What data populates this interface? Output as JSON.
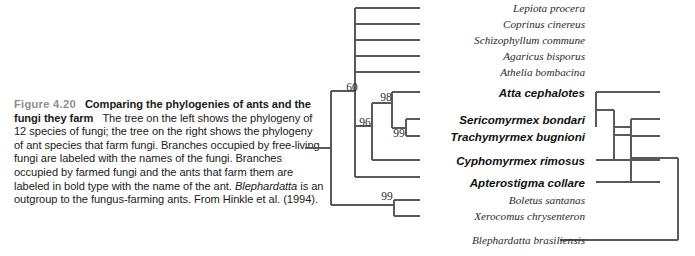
{
  "figure": {
    "number": "Figure 4.20",
    "lead": "Comparing the phylogenies of ants and the fungi they farm",
    "body_1": "The tree on the left shows the phylogeny of 12 species of fungi; the tree on the right shows the phylogeny of ant species that farm fungi. Branches occupied by free-living fungi are labeled with the names of the fungi. Branches occupied by farmed fungi and the ants that farm them are labeled in bold type with the name of the ant.",
    "italic_taxon": "Blephardatta",
    "body_2": "is an outgroup to the fungus-farming ants. From Hinkle et al. (1994)."
  },
  "taxa": [
    {
      "label": "Lepiota procera",
      "bold": false,
      "y": 8,
      "right": 585
    },
    {
      "label": "Coprinus cinereus",
      "bold": false,
      "y": 24,
      "right": 585
    },
    {
      "label": "Schizophyllum commune",
      "bold": false,
      "y": 40,
      "right": 585
    },
    {
      "label": "Agaricus bisporus",
      "bold": false,
      "y": 56,
      "right": 585
    },
    {
      "label": "Athelia bombacina",
      "bold": false,
      "y": 72,
      "right": 585
    },
    {
      "label": "Atta cephalotes",
      "bold": true,
      "y": 92,
      "right": 585
    },
    {
      "label": "Sericomyrmex bondari",
      "bold": true,
      "y": 119,
      "right": 585
    },
    {
      "label": "Trachymyrmex bugnioni",
      "bold": true,
      "y": 136,
      "right": 585
    },
    {
      "label": "Cyphomyrmex rimosus",
      "bold": true,
      "y": 160,
      "right": 585
    },
    {
      "label": "Apterostigma collare",
      "bold": true,
      "y": 182,
      "right": 585
    },
    {
      "label": "Boletus santanas",
      "bold": false,
      "y": 200,
      "right": 585
    },
    {
      "label": "Xerocomus chrysenteron",
      "bold": false,
      "y": 216,
      "right": 585
    },
    {
      "label": "Blephardatta brasiliensis",
      "bold": false,
      "y": 240,
      "right": 585
    }
  ],
  "bootstrap_fungi": [
    {
      "value": "60",
      "x": 352,
      "y": 87
    },
    {
      "value": "98",
      "x": 386,
      "y": 97
    },
    {
      "value": "96",
      "x": 365,
      "y": 122
    },
    {
      "value": "99",
      "x": 399,
      "y": 133
    },
    {
      "value": "99",
      "x": 387,
      "y": 196
    }
  ],
  "chart_data": {
    "type": "diagram",
    "title": "Comparing the phylogenies of ants and the fungi they farm",
    "n_fungi_species": 12,
    "fungi_tree": {
      "name": "fungi phylogeny (left tree)",
      "root_stem": {
        "x1": 305,
        "x2": 331,
        "y": 148
      },
      "tips": [
        "Lepiota procera",
        "Coprinus cinereus",
        "Schizophyllum commune",
        "Agaricus bisporus",
        "Athelia bombacina",
        "Atta cephalotes",
        "Sericomyrmex bondari",
        "Trachymyrmex bugnioni",
        "Cyphomyrmex rimosus",
        "Apterostigma collare",
        "Boletus santanas",
        "Xerocomus chrysenteron",
        "Blephardatta brasiliensis"
      ],
      "support_values": [
        60,
        98,
        96,
        99,
        99
      ]
    },
    "ant_tree": {
      "name": "ant phylogeny (right tree)",
      "tips": [
        "Atta cephalotes",
        "Sericomyrmex bondari",
        "Trachymyrmex bugnioni",
        "Cyphomyrmex rimosus",
        "Apterostigma collare",
        "Blephardatta brasiliensis"
      ],
      "outgroup": "Blephardatta brasiliensis"
    }
  }
}
